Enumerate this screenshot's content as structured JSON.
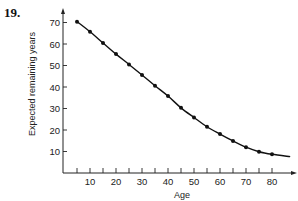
{
  "problem_number": "19.",
  "chart_data": {
    "type": "line",
    "title": "",
    "xlabel": "Age",
    "ylabel": "Expected remaining years",
    "xlim": [
      0,
      90
    ],
    "ylim": [
      0,
      75
    ],
    "x_ticks": [
      10,
      20,
      30,
      40,
      50,
      60,
      70,
      80
    ],
    "x_minor_ticks": [
      5,
      15,
      25,
      35,
      45,
      55,
      65,
      75
    ],
    "y_ticks": [
      10,
      20,
      30,
      40,
      50,
      60,
      70
    ],
    "grid": false,
    "legend": null,
    "series": [
      {
        "name": "Expected remaining years",
        "markers": true,
        "x": [
          5,
          10,
          15,
          20,
          25,
          30,
          35,
          40,
          45,
          50,
          55,
          60,
          65,
          70,
          75,
          80
        ],
        "values": [
          70.4,
          65.7,
          60.5,
          55.3,
          50.5,
          45.6,
          40.6,
          35.8,
          30.3,
          25.8,
          21.5,
          18.1,
          14.9,
          12.0,
          9.9,
          8.7
        ]
      }
    ],
    "curve_extends_to": {
      "x": 87,
      "y": 7.6
    }
  }
}
